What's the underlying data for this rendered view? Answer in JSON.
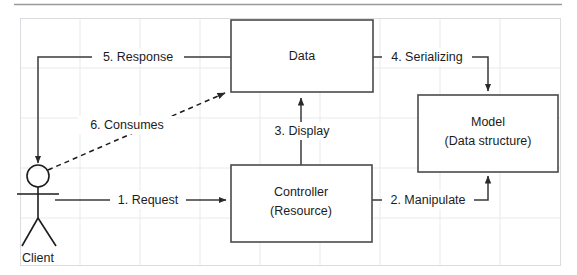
{
  "diagram": {
    "nodes": [
      {
        "id": "data",
        "label_line1": "Data",
        "label_line2": "",
        "x": 231,
        "y": 20,
        "w": 142,
        "h": 72
      },
      {
        "id": "controller",
        "label_line1": "Controller",
        "label_line2": "(Resource)",
        "x": 231,
        "y": 165,
        "w": 141,
        "h": 77
      },
      {
        "id": "model",
        "label_line1": "Model",
        "label_line2": "(Data structure)",
        "x": 418,
        "y": 95,
        "w": 140,
        "h": 77
      }
    ],
    "actor": {
      "id": "client",
      "label": "Client"
    },
    "edges": [
      {
        "id": "e1",
        "label": "1. Request",
        "style": "solid",
        "from": "client",
        "to": "controller"
      },
      {
        "id": "e2",
        "label": "2. Manipulate",
        "style": "solid",
        "from": "controller",
        "to": "model"
      },
      {
        "id": "e3",
        "label": "3. Display",
        "style": "solid",
        "from": "controller",
        "to": "data"
      },
      {
        "id": "e4",
        "label": "4. Serializing",
        "style": "solid",
        "from": "data",
        "to": "model"
      },
      {
        "id": "e5",
        "label": "5. Response",
        "style": "solid",
        "from": "data",
        "to": "client"
      },
      {
        "id": "e6",
        "label": "6. Consumes",
        "style": "dashed",
        "from": "client",
        "to": "data"
      }
    ],
    "colors": {
      "stroke": "#3a3a3a",
      "box_stroke": "#4a4a4a",
      "text": "#1c1c1c",
      "grid": "#e9e9ec",
      "frame": "#dcdce0",
      "background": "#ffffff"
    }
  }
}
